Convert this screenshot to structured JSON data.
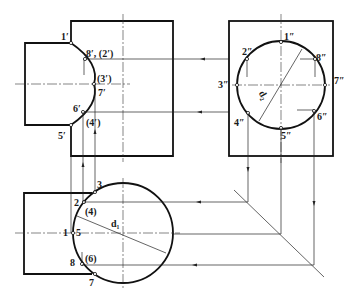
{
  "figure": {
    "type": "descriptive-geometry projection drawing",
    "views": [
      "front view",
      "side view",
      "top view"
    ]
  },
  "front_view": {
    "labels": {
      "p1": "1′",
      "p8_2": "8′, (2′)",
      "p3": "(3′)",
      "p7": "7′",
      "p6": "6′",
      "p4": "(4′)",
      "p5": "5′"
    }
  },
  "side_view": {
    "labels": {
      "p1": "1″",
      "p2": "2″",
      "p8": "8″",
      "p3": "3″",
      "p7": "7″",
      "p4": "4″",
      "p6": "6″",
      "p5": "5″",
      "dim": "d₂"
    }
  },
  "top_view": {
    "labels": {
      "p3": "3",
      "p2": "2",
      "p4": "(4)",
      "p1": "1",
      "p5": "5",
      "p6": "(6)",
      "p8": "8",
      "p7": "7",
      "dim": "d₁"
    }
  },
  "colors": {
    "line": "#111111",
    "background": "#ffffff"
  }
}
